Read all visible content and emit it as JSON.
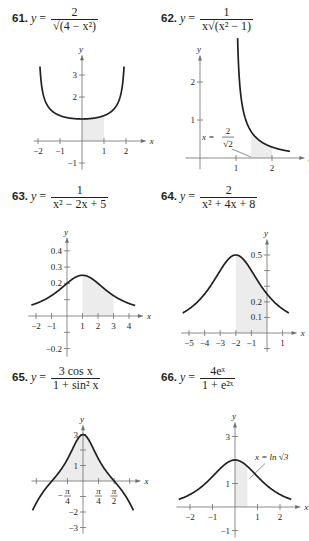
{
  "chart_data": [
    {
      "id": "61",
      "type": "line",
      "title": "61. y = 2 / sqrt(4 - x^2)",
      "equation": {
        "lhs": "y =",
        "num": "2",
        "den": "√(4 − x²)"
      },
      "xlabel": "x",
      "ylabel": "y",
      "xlim": [
        -2.2,
        2.9
      ],
      "ylim": [
        -1.3,
        3.9
      ],
      "xticks": [
        -2,
        -1,
        1,
        2
      ],
      "xtick_labels": [
        "−2",
        "−1",
        "1",
        "2"
      ],
      "yticks": [
        -1,
        1,
        2,
        3
      ],
      "ytick_labels": [
        "−1",
        "",
        "2",
        "3"
      ],
      "shaded_region": {
        "x_from": 0,
        "x_to": 1,
        "under": "curve"
      },
      "curve": {
        "fn": "2/sqrt(4-x^2)",
        "x_from": -1.97,
        "x_to": 1.97,
        "y_max": 3.5
      },
      "grid": false
    },
    {
      "id": "62",
      "type": "line",
      "title": "62. y = 1 / (x sqrt(x^2 - 1))",
      "equation": {
        "lhs": "y =",
        "num": "1",
        "den": "x√(x² − 1)"
      },
      "xlabel": "x",
      "ylabel": "y",
      "xlim": [
        -0.4,
        2.9
      ],
      "ylim": [
        -0.3,
        2.7
      ],
      "xticks": [
        1,
        2
      ],
      "xtick_labels": [
        "1",
        "2"
      ],
      "yticks": [
        1,
        2
      ],
      "ytick_labels": [
        "1",
        "2"
      ],
      "shaded_region": {
        "x_from": 1.414,
        "x_to": 2,
        "under": "curve"
      },
      "annotation": {
        "text_lhs": "x =",
        "num": "2",
        "den": "√2",
        "points_to_x": 1.414
      },
      "curve": {
        "fn": "1/(x*sqrt(x^2-1))",
        "x_from": 1.045,
        "x_to": 2.5
      },
      "grid": false
    },
    {
      "id": "63",
      "type": "line",
      "title": "63. y = 1 / (x^2 - 2x + 5)",
      "equation": {
        "lhs": "y =",
        "num": "1",
        "den": "x² − 2x + 5"
      },
      "xlabel": "x",
      "ylabel": "y",
      "xlim": [
        -2.5,
        4.9
      ],
      "ylim": [
        -0.25,
        0.48
      ],
      "xticks": [
        -2,
        -1,
        1,
        2,
        3,
        4
      ],
      "xtick_labels": [
        "−2",
        "−1",
        "1",
        "2",
        "3",
        "4"
      ],
      "yticks": [
        -0.2,
        -0.1,
        0.1,
        0.2,
        0.3,
        0.4
      ],
      "ytick_labels": [
        "−0.2",
        "",
        "",
        "0.2",
        "0.3",
        "0.4"
      ],
      "shaded_region": {
        "x_from": 1,
        "x_to": 3,
        "under": "curve"
      },
      "curve": {
        "fn": "1/(x^2-2x+5)",
        "x_from": -2.3,
        "x_to": 4.4
      },
      "grid": false
    },
    {
      "id": "64",
      "type": "line",
      "title": "64. y = 2 / (x^2 + 4x + 8)",
      "equation": {
        "lhs": "y =",
        "num": "2",
        "den": "x² + 4x + 8"
      },
      "xlabel": "x",
      "ylabel": "y",
      "xlim": [
        -5.5,
        1.9
      ],
      "ylim": [
        -0.12,
        0.6
      ],
      "xticks": [
        -5,
        -4,
        -3,
        -2,
        -1,
        1
      ],
      "xtick_labels": [
        "−5",
        "−4",
        "−3",
        "−2",
        "−1",
        "1"
      ],
      "yticks": [
        -0.1,
        0.1,
        0.2,
        0.3,
        0.4,
        0.5
      ],
      "ytick_labels": [
        "",
        "0.1",
        "0.2",
        "",
        "",
        "0.5"
      ],
      "shaded_region": {
        "x_from": -2,
        "x_to": 0,
        "under": "curve"
      },
      "curve": {
        "fn": "2/(x^2+4x+8)",
        "x_from": -5.4,
        "x_to": 1.4
      },
      "grid": false
    },
    {
      "id": "65",
      "type": "line",
      "title": "65. y = 3 cos x / (1 + sin^2 x)",
      "equation": {
        "lhs": "y =",
        "num": "3 cos x",
        "den": "1 + sin² x"
      },
      "xlabel": "x",
      "ylabel": "y",
      "xlim": [
        -2.6,
        2.9
      ],
      "ylim": [
        -3.4,
        3.6
      ],
      "xticks": [
        -2.356,
        -0.785,
        0.785,
        1.571,
        2.356
      ],
      "xtick_labels": [
        "",
        "−π/4",
        "π/4",
        "π/2",
        ""
      ],
      "yticks": [
        -3,
        -2,
        -1,
        1,
        2,
        3
      ],
      "ytick_labels": [
        "−3",
        "−2",
        "",
        "1",
        "",
        "3"
      ],
      "shaded_region": {
        "x_from": -1.571,
        "x_to": 1.571,
        "under": "curve"
      },
      "curve": {
        "fn": "3cos(x)/(1+sin(x)^2)",
        "x_from": -2.55,
        "x_to": 2.55
      },
      "grid": false
    },
    {
      "id": "66",
      "type": "line",
      "title": "66. y = 4e^x / (1 + e^(2x))",
      "equation": {
        "lhs": "y =",
        "num": "4eˣ",
        "den": "1 + e²ˣ"
      },
      "xlabel": "x",
      "ylabel": "y",
      "xlim": [
        -2.6,
        2.9
      ],
      "ylim": [
        -1.3,
        3.6
      ],
      "xticks": [
        -2,
        -1,
        1,
        2
      ],
      "xtick_labels": [
        "−2",
        "−1",
        "1",
        "2"
      ],
      "yticks": [
        -1,
        1,
        2,
        3
      ],
      "ytick_labels": [
        "−1",
        "1",
        "",
        "3"
      ],
      "shaded_region": {
        "x_from": 0,
        "x_to": 0.549,
        "under": "curve"
      },
      "annotation": {
        "text": "x = ln √3",
        "points_to_x": 0.549
      },
      "curve": {
        "fn": "4e^x/(1+e^(2x))",
        "x_from": -2.5,
        "x_to": 2.5
      },
      "grid": false
    }
  ]
}
